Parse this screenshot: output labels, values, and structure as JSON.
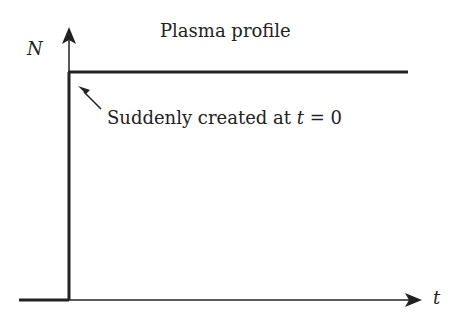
{
  "diagram": {
    "title": "Plasma profile",
    "y_axis_label": "N",
    "x_axis_label": "t",
    "annotation": {
      "prefix": "Suddenly created at ",
      "variable": "t",
      "suffix": " = 0"
    }
  },
  "colors": {
    "line": "#222222",
    "background": "#ffffff"
  }
}
